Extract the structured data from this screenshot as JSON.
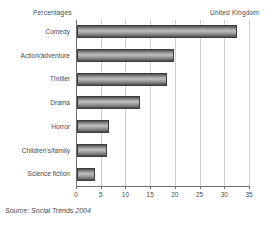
{
  "header": {
    "units_label": "Percentages",
    "region_label": "United Kingdom"
  },
  "source": "Source: Social Trends 2004",
  "colors": {
    "bar_dark": "#454545",
    "bar_light": "#bdbdbd",
    "axis": "#6e6e6e",
    "gridline": "#cfcfcf",
    "text": "#4a4a4a",
    "background": "#ffffff"
  },
  "chart_data": {
    "type": "bar",
    "orientation": "horizontal",
    "title": "",
    "subtitle": "",
    "xlabel": "",
    "ylabel": "",
    "units": "Percentages",
    "region": "United Kingdom",
    "categories": [
      "Comedy",
      "Action/adventure",
      "Thriller",
      "Drama",
      "Horror",
      "Children's/family",
      "Science fiction"
    ],
    "values": [
      32.3,
      19.6,
      18.2,
      12.8,
      6.4,
      6.0,
      3.6
    ],
    "xlim": [
      0,
      35
    ],
    "xticks": [
      0,
      5,
      10,
      15,
      20,
      25,
      30,
      35
    ],
    "xticklabels": [
      "0",
      "5",
      "10",
      "15",
      "20",
      "25",
      "30",
      "35"
    ],
    "grid": true,
    "grid_axis": "x",
    "legend": false,
    "legend_position": "none",
    "annotations": []
  }
}
